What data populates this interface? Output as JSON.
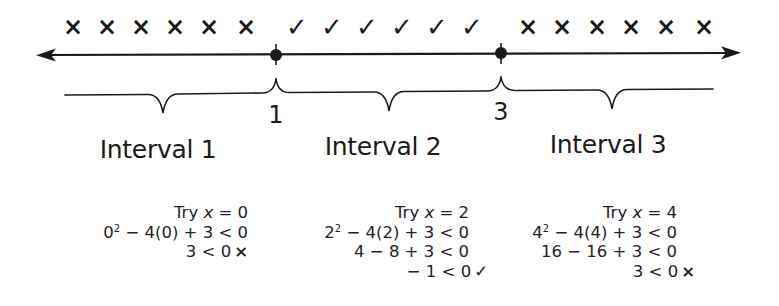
{
  "number_line": {
    "points": [
      {
        "label": "1",
        "value": 1,
        "x": 276,
        "filled": true
      },
      {
        "label": "3",
        "value": 3,
        "x": 501,
        "filled": true
      }
    ],
    "arrows": "both-ends"
  },
  "test_marks": {
    "interval_1": {
      "symbol": "×",
      "count": 6,
      "meaning": "fails"
    },
    "interval_2": {
      "symbol": "✓",
      "count": 6,
      "meaning": "satisfies"
    },
    "interval_3": {
      "symbol": "×",
      "count": 6,
      "meaning": "fails"
    }
  },
  "intervals": [
    {
      "label": "Interval 1",
      "test": {
        "try_prefix": "Try ",
        "var": "x",
        "try_suffix": " = 0",
        "steps": [
          {
            "base": "0",
            "exp": "2",
            "rest": " − 4(0) + 3 < 0"
          },
          {
            "text": "3 < 0",
            "result": "×"
          }
        ]
      }
    },
    {
      "label": "Interval 2",
      "test": {
        "try_prefix": "Try ",
        "var": "x",
        "try_suffix": " = 2",
        "steps": [
          {
            "base": "2",
            "exp": "2",
            "rest": " − 4(2) + 3 < 0"
          },
          {
            "text": "4 − 8 + 3 < 0"
          },
          {
            "text": "− 1 < 0",
            "result": "✓"
          }
        ]
      }
    },
    {
      "label": "Interval 3",
      "test": {
        "try_prefix": "Try ",
        "var": "x",
        "try_suffix": " = 4",
        "steps": [
          {
            "base": "4",
            "exp": "2",
            "rest": " − 4(4) + 3 < 0"
          },
          {
            "text": "16 − 16 + 3 < 0"
          },
          {
            "text": "3 < 0",
            "result": "×"
          }
        ]
      }
    }
  ],
  "colors": {
    "ink": "#1a1a1a",
    "background": "#ffffff"
  }
}
